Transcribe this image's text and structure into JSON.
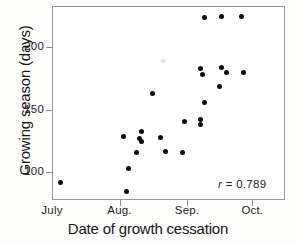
{
  "figure": {
    "background": "#fdfdfb",
    "point_color": "#0b0b0b",
    "frame_color": "#9a9a96"
  },
  "annotation": {
    "symbol": "r",
    "text": " = 0.789"
  },
  "chart_data": {
    "type": "scatter",
    "title": "",
    "xlabel": "Date of growth cessation",
    "ylabel": "Growing season (days)",
    "xtick_labels": [
      "July",
      "Aug.",
      "Sep.",
      "Oct."
    ],
    "ytick_labels": [
      "100",
      "150",
      "200"
    ],
    "ytick_values": [
      100,
      150,
      200
    ],
    "ylim": [
      78,
      233
    ],
    "xlim": [
      0,
      107
    ],
    "grid": false,
    "legend": null,
    "annotations": [
      {
        "text": "r = 0.789",
        "x_frac": 0.72,
        "y_frac": 0.9
      }
    ],
    "x_axis_note": "x positions expressed as days after July 1; tick marks at July 1 (day 0), Aug. 1 (day 31), Sep. 1 (day 62), Oct. 1 (day 92)",
    "correlation_r": 0.789,
    "n_points": 28,
    "points": [
      {
        "x": 4,
        "y": 92
      },
      {
        "x": 34,
        "y": 85
      },
      {
        "x": 35,
        "y": 103
      },
      {
        "x": 33,
        "y": 129
      },
      {
        "x": 41,
        "y": 133
      },
      {
        "x": 40,
        "y": 127
      },
      {
        "x": 41,
        "y": 125
      },
      {
        "x": 39,
        "y": 116
      },
      {
        "x": 46,
        "y": 163
      },
      {
        "x": 50,
        "y": 128
      },
      {
        "x": 52,
        "y": 117
      },
      {
        "x": 60,
        "y": 116
      },
      {
        "x": 61,
        "y": 141
      },
      {
        "x": 68,
        "y": 142
      },
      {
        "x": 68,
        "y": 138
      },
      {
        "x": 70,
        "y": 156
      },
      {
        "x": 68,
        "y": 183
      },
      {
        "x": 69,
        "y": 178
      },
      {
        "x": 78,
        "y": 184
      },
      {
        "x": 80,
        "y": 180
      },
      {
        "x": 77,
        "y": 169
      },
      {
        "x": 88,
        "y": 180
      },
      {
        "x": 70,
        "y": 224
      },
      {
        "x": 78,
        "y": 225
      },
      {
        "x": 87,
        "y": 225
      }
    ]
  }
}
